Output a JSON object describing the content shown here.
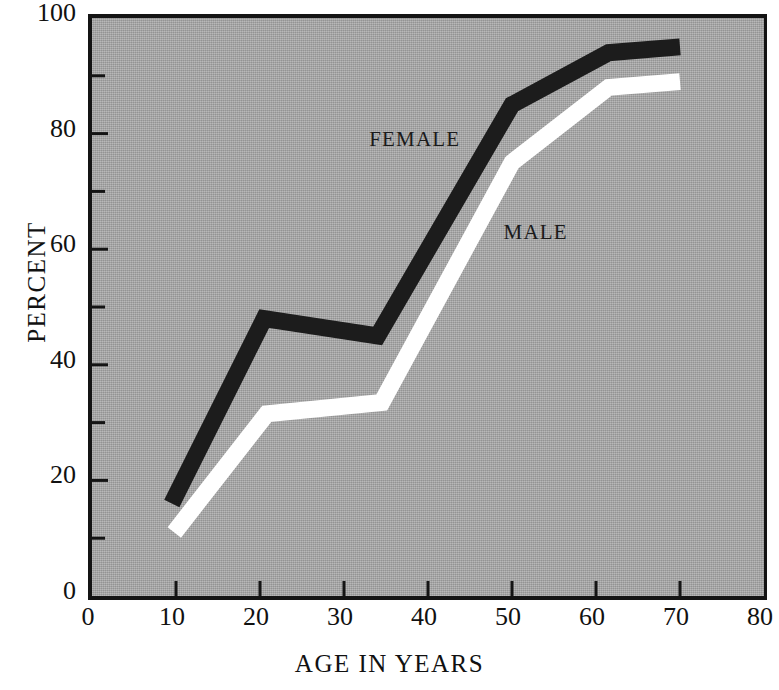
{
  "chart_data": {
    "type": "line",
    "title": "",
    "xlabel": "AGE IN YEARS",
    "ylabel": "PERCENT",
    "xlim": [
      0,
      80
    ],
    "ylim": [
      0,
      100
    ],
    "xticks": [
      0,
      10,
      20,
      30,
      40,
      50,
      60,
      70,
      80
    ],
    "xtick_labels": [
      "0",
      "10",
      "20",
      "30",
      "40",
      "50",
      "60",
      "70",
      "80"
    ],
    "yticks": [
      0,
      20,
      40,
      60,
      80,
      100
    ],
    "ytick_labels": [
      "0",
      "20",
      "40",
      "60",
      "80",
      "100"
    ],
    "y_minor_ticks": [
      10,
      30,
      50,
      70,
      90
    ],
    "grid": false,
    "legend": "inline-labels",
    "background_color": "#a8a8a8",
    "axis_color": "#141414",
    "series": [
      {
        "name": "FEMALE",
        "color": "#1c1c1c",
        "label_position": {
          "x": 33,
          "y": 79
        },
        "x": [
          9.5,
          20.5,
          34,
          50,
          61.5,
          70
        ],
        "values": [
          16,
          48,
          45,
          85,
          94,
          95
        ]
      },
      {
        "name": "MALE",
        "color": "#ffffff",
        "label_position": {
          "x": 49,
          "y": 63
        },
        "x": [
          9.8,
          20.8,
          34.5,
          50,
          61.5,
          70
        ],
        "values": [
          11,
          31.5,
          33.5,
          75,
          88,
          89
        ]
      }
    ]
  },
  "labels": {
    "female": "FEMALE",
    "male": "MALE",
    "x_axis_title": "AGE IN YEARS",
    "y_axis_title": "PERCENT"
  }
}
